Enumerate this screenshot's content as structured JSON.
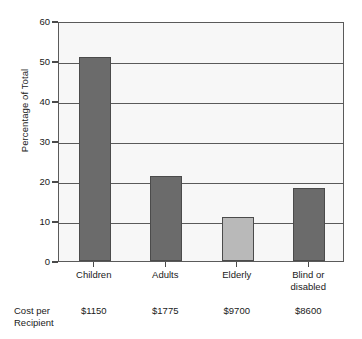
{
  "chart_data": {
    "type": "bar",
    "title": "",
    "xlabel": "",
    "ylabel": "Percentage of Total",
    "categories": [
      "Children",
      "Adults",
      "Elderly",
      "Blind or disabled"
    ],
    "category_lines": [
      [
        "Children"
      ],
      [
        "Adults"
      ],
      [
        "Elderly"
      ],
      [
        "Blind or",
        "disabled"
      ]
    ],
    "values": [
      51.0,
      21.3,
      11.1,
      18.3
    ],
    "bar_colors": [
      "#6b6b6b",
      "#6b6b6b",
      "#b9b9b9",
      "#6b6b6b"
    ],
    "ylim": [
      0,
      60
    ],
    "yticks": [
      0,
      10,
      20,
      30,
      40,
      50,
      60
    ],
    "ytick_labels": [
      "0",
      "10",
      "20",
      "30",
      "40",
      "50",
      "60"
    ],
    "grid": true,
    "grid_axis": "y",
    "legend": "none",
    "annotation_row": {
      "label_lines": [
        "Cost per",
        "Recipient"
      ],
      "values": [
        "$1150",
        "$1775",
        "$9700",
        "$8600"
      ]
    }
  },
  "style": {
    "plot_background": "#f7f7f7",
    "axis_color": "#5a5a5a",
    "gridline_color": "#5a5a5a",
    "text_color": "#1a1a1a"
  }
}
